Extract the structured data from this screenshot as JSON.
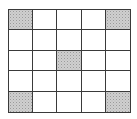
{
  "grid": {
    "rows": 5,
    "cols": 5,
    "line_color": "#3a3a3a",
    "shade_color": "#cfcfcf",
    "shaded_cells": [
      [
        0,
        0
      ],
      [
        0,
        4
      ],
      [
        2,
        2
      ],
      [
        4,
        0
      ],
      [
        4,
        4
      ]
    ]
  }
}
